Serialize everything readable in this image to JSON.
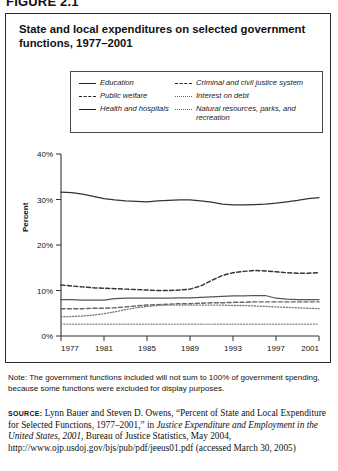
{
  "figure": {
    "label": "FIGURE 2.1"
  },
  "title": "State and local expenditures on selected government functions, 1977–2001",
  "legend": {
    "left": [
      {
        "label": "Education",
        "style": "solid"
      },
      {
        "label": "Public welfare",
        "style": "dash"
      },
      {
        "label": "Health and hospitals",
        "style": "solid"
      }
    ],
    "right": [
      {
        "label": "Criminal and civil justice system",
        "style": "dash"
      },
      {
        "label": "Interest on debt",
        "style": "dot"
      },
      {
        "label": "Natural resources, parks, and recreation",
        "style": "dot"
      }
    ]
  },
  "axis": {
    "y_title": "Percent",
    "y_ticks": [
      "0%",
      "10%",
      "20%",
      "30%",
      "40%"
    ],
    "x_ticks": [
      "1977",
      "1981",
      "1985",
      "1989",
      "1993",
      "1997",
      "2001"
    ]
  },
  "note": "Note: The government functions included will not sum to 100% of government spending, because some functions were excluded for display purposes.",
  "source": {
    "label": "SOURCE:",
    "text_1": " Lynn Bauer and Steven D. Owens, “Percent of State and Local Expenditure for Selected Functions, 1977–2001,” in ",
    "italic_1": "Justice Expenditure and Employment in the United States, 2001",
    "text_2": ", Bureau of Justice Statistics, May 2004, http://www.ojp.usdoj.gov/bjs/pub/pdf/jeeus01.pdf (accessed March 30, 2005)"
  },
  "chart_data": {
    "type": "line",
    "title": "State and local expenditures on selected government functions, 1977–2001",
    "xlabel": "",
    "ylabel": "Percent",
    "xlim": [
      1977,
      2001
    ],
    "ylim": [
      0,
      40
    ],
    "grid": false,
    "legend_position": "top",
    "x": [
      1977,
      1978,
      1979,
      1980,
      1981,
      1982,
      1983,
      1984,
      1985,
      1986,
      1987,
      1988,
      1989,
      1990,
      1991,
      1992,
      1993,
      1994,
      1995,
      1996,
      1997,
      1998,
      1999,
      2000,
      2001
    ],
    "series": [
      {
        "name": "Education",
        "style": "solid",
        "color": "#333333",
        "values": [
          31.6,
          31.5,
          31.2,
          30.7,
          30.2,
          29.9,
          29.7,
          29.6,
          29.5,
          29.7,
          29.8,
          29.9,
          29.9,
          29.7,
          29.4,
          29.0,
          28.8,
          28.8,
          28.9,
          29.0,
          29.2,
          29.5,
          29.8,
          30.2,
          30.4
        ]
      },
      {
        "name": "Public welfare",
        "style": "dash",
        "color": "#333333",
        "values": [
          11.2,
          11.0,
          10.8,
          10.6,
          10.5,
          10.4,
          10.3,
          10.2,
          10.1,
          10.0,
          10.0,
          10.1,
          10.3,
          11.0,
          12.2,
          13.3,
          13.9,
          14.2,
          14.4,
          14.3,
          14.1,
          13.9,
          13.8,
          13.8,
          13.9
        ]
      },
      {
        "name": "Health and hospitals",
        "style": "solid",
        "color": "#555555",
        "values": [
          8.0,
          8.0,
          7.9,
          7.9,
          7.9,
          8.2,
          8.3,
          8.3,
          8.3,
          8.3,
          8.3,
          8.4,
          8.4,
          8.5,
          8.6,
          8.7,
          8.8,
          8.8,
          8.9,
          8.9,
          8.3,
          8.1,
          8.0,
          8.0,
          8.0
        ]
      },
      {
        "name": "Criminal and civil justice system",
        "style": "dash",
        "color": "#666666",
        "values": [
          6.0,
          6.0,
          6.0,
          6.1,
          6.1,
          6.2,
          6.4,
          6.6,
          6.8,
          6.9,
          7.0,
          7.1,
          7.1,
          7.2,
          7.3,
          7.3,
          7.4,
          7.4,
          7.5,
          7.5,
          7.5,
          7.5,
          7.5,
          7.5,
          7.5
        ]
      },
      {
        "name": "Interest on debt",
        "style": "dot",
        "color": "#777777",
        "values": [
          4.2,
          4.3,
          4.4,
          4.6,
          4.9,
          5.3,
          5.8,
          6.2,
          6.5,
          6.7,
          6.8,
          6.8,
          6.8,
          6.8,
          6.8,
          6.8,
          6.7,
          6.7,
          6.6,
          6.5,
          6.4,
          6.3,
          6.2,
          6.1,
          6.0
        ]
      },
      {
        "name": "Natural resources, parks, and recreation",
        "style": "dot",
        "color": "#8a8a8a",
        "values": [
          2.6,
          2.6,
          2.6,
          2.6,
          2.6,
          2.6,
          2.6,
          2.6,
          2.6,
          2.6,
          2.6,
          2.6,
          2.6,
          2.6,
          2.6,
          2.6,
          2.6,
          2.6,
          2.6,
          2.6,
          2.6,
          2.6,
          2.6,
          2.6,
          2.6
        ]
      }
    ]
  }
}
